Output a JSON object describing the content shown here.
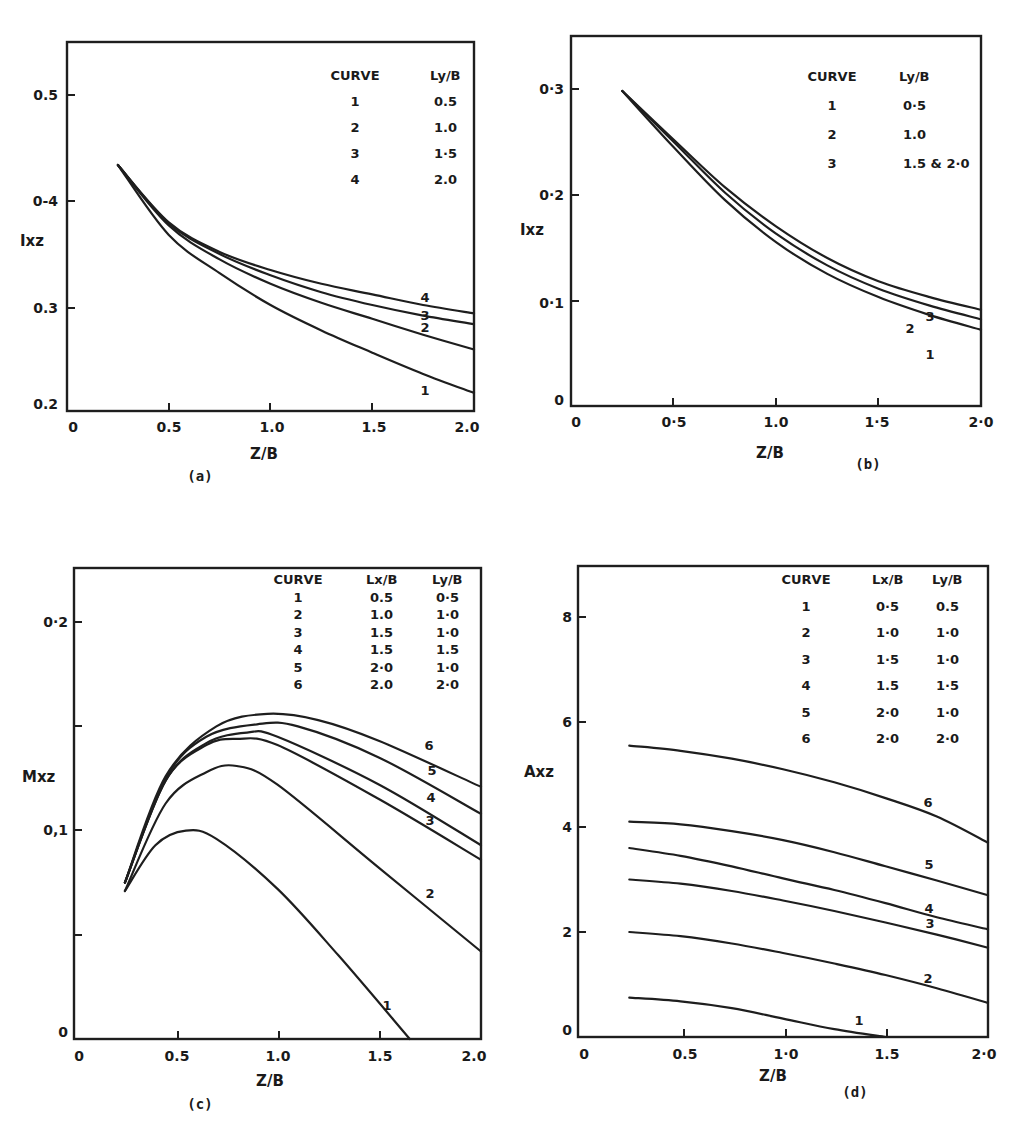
{
  "chart_data": [
    {
      "panel": "(a)",
      "type": "line",
      "xlabel": "Z/B",
      "ylabel": "Ixz",
      "xlim": [
        0,
        2.0
      ],
      "ylim": [
        0.2,
        0.55
      ],
      "xticks": [
        "0",
        "0.5",
        "1.0",
        "1.5",
        "2.0"
      ],
      "yticks": [
        "0.2",
        "0.3",
        "0-4",
        "0.5"
      ],
      "grid": false,
      "legend": {
        "headers": [
          "CURVE",
          "Ly/B"
        ],
        "rows": [
          [
            "1",
            "0.5"
          ],
          [
            "2",
            "1.0"
          ],
          [
            "3",
            "1·5"
          ],
          [
            "4",
            "2.0"
          ]
        ]
      },
      "series": [
        {
          "name": "1",
          "x": [
            0.25,
            0.5,
            0.75,
            1.0,
            1.25,
            1.5,
            1.75,
            2.0
          ],
          "y": [
            0.432,
            0.366,
            0.33,
            0.3,
            0.276,
            0.255,
            0.235,
            0.217
          ]
        },
        {
          "name": "2",
          "x": [
            0.25,
            0.5,
            0.75,
            1.0,
            1.25,
            1.5,
            1.75,
            2.0
          ],
          "y": [
            0.432,
            0.375,
            0.343,
            0.32,
            0.302,
            0.287,
            0.272,
            0.258
          ]
        },
        {
          "name": "3",
          "x": [
            0.25,
            0.5,
            0.75,
            1.0,
            1.25,
            1.5,
            1.75,
            2.0
          ],
          "y": [
            0.432,
            0.377,
            0.348,
            0.328,
            0.312,
            0.3,
            0.29,
            0.282
          ]
        },
        {
          "name": "4",
          "x": [
            0.25,
            0.5,
            0.75,
            1.0,
            1.25,
            1.5,
            1.75,
            2.0
          ],
          "y": [
            0.432,
            0.378,
            0.35,
            0.333,
            0.32,
            0.31,
            0.3,
            0.292
          ]
        }
      ]
    },
    {
      "panel": "(b)",
      "type": "line",
      "xlabel": "Z/B",
      "ylabel": "Ixz",
      "xlim": [
        0,
        2.0
      ],
      "ylim": [
        0,
        0.35
      ],
      "xticks": [
        "0",
        "0·5",
        "1.0",
        "1·5",
        "2·0"
      ],
      "yticks": [
        "0",
        "0·1",
        "0·2",
        "0·3"
      ],
      "grid": false,
      "legend": {
        "headers": [
          "CURVE",
          "Ly/B"
        ],
        "rows": [
          [
            "1",
            "0·5"
          ],
          [
            "2",
            "1.0"
          ],
          [
            "3",
            "1.5 & 2·0"
          ]
        ]
      },
      "series": [
        {
          "name": "1",
          "x": [
            0.25,
            0.5,
            0.75,
            1.0,
            1.25,
            1.5,
            1.75,
            2.0
          ],
          "y": [
            0.298,
            0.245,
            0.195,
            0.155,
            0.125,
            0.103,
            0.086,
            0.072
          ]
        },
        {
          "name": "2",
          "x": [
            0.25,
            0.5,
            0.75,
            1.0,
            1.25,
            1.5,
            1.75,
            2.0
          ],
          "y": [
            0.298,
            0.25,
            0.202,
            0.163,
            0.133,
            0.111,
            0.095,
            0.082
          ]
        },
        {
          "name": "3",
          "x": [
            0.25,
            0.5,
            0.75,
            1.0,
            1.25,
            1.5,
            1.75,
            2.0
          ],
          "y": [
            0.298,
            0.252,
            0.207,
            0.17,
            0.14,
            0.118,
            0.103,
            0.091
          ]
        }
      ]
    },
    {
      "panel": "(c)",
      "type": "line",
      "xlabel": "Z/B",
      "ylabel": "Mxz",
      "xlim": [
        0,
        2.0
      ],
      "ylim": [
        0,
        0.22
      ],
      "xticks": [
        "0",
        "0.5",
        "1.0",
        "1.5",
        "2.0"
      ],
      "yticks": [
        "0",
        "0,1",
        "0·2"
      ],
      "grid": false,
      "legend": {
        "headers": [
          "CURVE",
          "Lx/B",
          "Ly/B"
        ],
        "rows": [
          [
            "1",
            "0.5",
            "0·5"
          ],
          [
            "2",
            "1.0",
            "1·0"
          ],
          [
            "3",
            "1.5",
            "1·0"
          ],
          [
            "4",
            "1.5",
            "1.5"
          ],
          [
            "5",
            "2·0",
            "1·0"
          ],
          [
            "6",
            "2.0",
            "2·0"
          ]
        ]
      },
      "series": [
        {
          "name": "1",
          "x": [
            0.25,
            0.4,
            0.55,
            0.7,
            1.0,
            1.3,
            1.65
          ],
          "y": [
            0.071,
            0.093,
            0.1,
            0.096,
            0.072,
            0.04,
            0.0
          ]
        },
        {
          "name": "2",
          "x": [
            0.25,
            0.45,
            0.65,
            0.8,
            1.0,
            1.5,
            2.0
          ],
          "y": [
            0.071,
            0.113,
            0.128,
            0.131,
            0.122,
            0.082,
            0.042
          ]
        },
        {
          "name": "3",
          "x": [
            0.25,
            0.45,
            0.65,
            0.8,
            1.0,
            1.5,
            2.0
          ],
          "y": [
            0.075,
            0.124,
            0.141,
            0.144,
            0.141,
            0.115,
            0.086
          ]
        },
        {
          "name": "4",
          "x": [
            0.25,
            0.45,
            0.65,
            0.85,
            1.0,
            1.5,
            2.0
          ],
          "y": [
            0.075,
            0.124,
            0.142,
            0.147,
            0.145,
            0.122,
            0.093
          ]
        },
        {
          "name": "5",
          "x": [
            0.25,
            0.45,
            0.65,
            0.9,
            1.1,
            1.5,
            2.0
          ],
          "y": [
            0.075,
            0.125,
            0.145,
            0.151,
            0.15,
            0.135,
            0.108
          ]
        },
        {
          "name": "6",
          "x": [
            0.25,
            0.45,
            0.7,
            0.95,
            1.2,
            1.5,
            2.0
          ],
          "y": [
            0.075,
            0.126,
            0.15,
            0.156,
            0.153,
            0.143,
            0.121
          ]
        }
      ]
    },
    {
      "panel": "(d)",
      "type": "line",
      "xlabel": "Z/B",
      "ylabel": "Axz",
      "xlim": [
        0,
        2.0
      ],
      "ylim": [
        0,
        9
      ],
      "xticks": [
        "0",
        "0.5",
        "1·0",
        "1.5",
        "2·0"
      ],
      "yticks": [
        "0",
        "2",
        "4",
        "6",
        "8"
      ],
      "grid": false,
      "legend": {
        "headers": [
          "CURVE",
          "Lx/B",
          "Ly/B"
        ],
        "rows": [
          [
            "1",
            "0·5",
            "0.5"
          ],
          [
            "2",
            "1·0",
            "1·0"
          ],
          [
            "3",
            "1·5",
            "1·0"
          ],
          [
            "4",
            "1.5",
            "1·5"
          ],
          [
            "5",
            "2·0",
            "1·0"
          ],
          [
            "6",
            "2·0",
            "2·0"
          ]
        ]
      },
      "series": [
        {
          "name": "1",
          "x": [
            0.25,
            0.5,
            0.75,
            1.0,
            1.25,
            1.5
          ],
          "y": [
            0.75,
            0.68,
            0.55,
            0.35,
            0.15,
            0.0
          ]
        },
        {
          "name": "2",
          "x": [
            0.25,
            0.5,
            0.75,
            1.0,
            1.25,
            1.5,
            1.75,
            2.0
          ],
          "y": [
            2.0,
            1.92,
            1.78,
            1.6,
            1.4,
            1.18,
            0.93,
            0.65
          ]
        },
        {
          "name": "3",
          "x": [
            0.25,
            0.5,
            0.75,
            1.0,
            1.25,
            1.5,
            1.75,
            2.0
          ],
          "y": [
            3.0,
            2.92,
            2.78,
            2.6,
            2.4,
            2.18,
            1.95,
            1.7
          ]
        },
        {
          "name": "4",
          "x": [
            0.25,
            0.5,
            0.75,
            1.0,
            1.25,
            1.5,
            1.75,
            2.0
          ],
          "y": [
            3.6,
            3.45,
            3.25,
            3.02,
            2.8,
            2.55,
            2.28,
            2.05
          ]
        },
        {
          "name": "5",
          "x": [
            0.25,
            0.5,
            0.75,
            1.0,
            1.25,
            1.5,
            1.75,
            2.0
          ],
          "y": [
            4.1,
            4.05,
            3.92,
            3.75,
            3.52,
            3.25,
            2.98,
            2.7
          ]
        },
        {
          "name": "6",
          "x": [
            0.25,
            0.5,
            0.75,
            1.0,
            1.25,
            1.5,
            1.75,
            2.0
          ],
          "y": [
            5.55,
            5.45,
            5.3,
            5.1,
            4.85,
            4.55,
            4.2,
            3.7
          ]
        }
      ]
    }
  ],
  "figure": {
    "panel_labels": [
      "(a)",
      "(b)",
      "(c)",
      "(d)"
    ]
  }
}
